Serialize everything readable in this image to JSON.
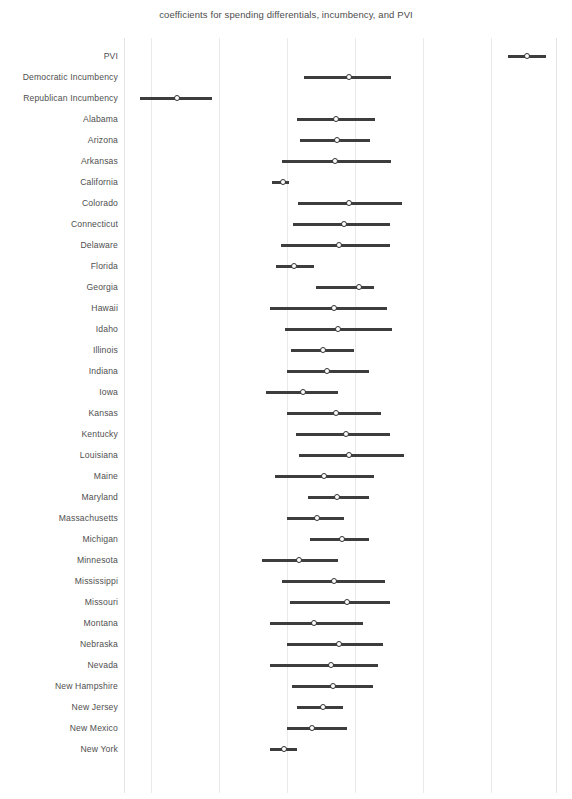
{
  "chart_data": {
    "type": "scatter",
    "title": "coefficients for spending differentials, incumbency, and PVI",
    "xlabel": "",
    "ylabel": "",
    "grid": true,
    "legend": null,
    "xlim": [
      -3.0,
      3.35
    ],
    "x_gridlines": [
      -2.6,
      -1.6,
      -0.6,
      0.4,
      1.4,
      2.4
    ],
    "plot_px": {
      "left": 124,
      "right": 556,
      "top": 38,
      "bottom": 793
    },
    "row_height_px": 21,
    "first_row_center_y_px": 56,
    "marker": "point-with-error-bar",
    "point_color": "#ffffff",
    "point_edge_color": "#2f2f2f",
    "bar_color": "#3d3d3d",
    "grid_color": "#e9e9ec",
    "categories": [
      "PVI",
      "Democratic Incumbency",
      "Republican Incumbency",
      "Alabama",
      "Arizona",
      "Arkansas",
      "California",
      "Colorado",
      "Connecticut",
      "Delaware",
      "Florida",
      "Georgia",
      "Hawaii",
      "Idaho",
      "Illinois",
      "Indiana",
      "Iowa",
      "Kansas",
      "Kentucky",
      "Louisiana",
      "Maine",
      "Maryland",
      "Massachusetts",
      "Michigan",
      "Minnesota",
      "Mississippi",
      "Missouri",
      "Montana",
      "Nebraska",
      "Nevada",
      "New Hampshire",
      "New Jersey",
      "New Mexico",
      "New York"
    ],
    "points": [
      {
        "label": "PVI",
        "estimate": 2.92,
        "low": 2.65,
        "high": 3.2
      },
      {
        "label": "Democratic Incumbency",
        "estimate": 0.3,
        "low": -0.35,
        "high": 0.93
      },
      {
        "label": "Republican Incumbency",
        "estimate": -2.22,
        "low": -2.76,
        "high": -1.7
      },
      {
        "label": "Alabama",
        "estimate": 0.12,
        "low": -0.46,
        "high": 0.69
      },
      {
        "label": "Arizona",
        "estimate": 0.13,
        "low": -0.42,
        "high": 0.62
      },
      {
        "label": "Arkansas",
        "estimate": 0.1,
        "low": -0.68,
        "high": 0.93
      },
      {
        "label": "California",
        "estimate": -0.67,
        "low": -0.83,
        "high": -0.58
      },
      {
        "label": "Colorado",
        "estimate": 0.3,
        "low": -0.44,
        "high": 1.09
      },
      {
        "label": "Connecticut",
        "estimate": 0.23,
        "low": -0.52,
        "high": 0.91
      },
      {
        "label": "Delaware",
        "estimate": 0.16,
        "low": -0.69,
        "high": 0.91
      },
      {
        "label": "Florida",
        "estimate": -0.5,
        "low": -0.76,
        "high": -0.2
      },
      {
        "label": "Georgia",
        "estimate": 0.45,
        "low": -0.18,
        "high": 0.68
      },
      {
        "label": "Hawaii",
        "estimate": 0.09,
        "low": -0.86,
        "high": 0.86
      },
      {
        "label": "Idaho",
        "estimate": 0.15,
        "low": -0.63,
        "high": 0.94
      },
      {
        "label": "Illinois",
        "estimate": -0.07,
        "low": -0.55,
        "high": 0.38
      },
      {
        "label": "Indiana",
        "estimate": -0.01,
        "low": -0.61,
        "high": 0.6
      },
      {
        "label": "Iowa",
        "estimate": -0.37,
        "low": -0.92,
        "high": 0.15
      },
      {
        "label": "Kansas",
        "estimate": 0.11,
        "low": -0.61,
        "high": 0.78
      },
      {
        "label": "Kentucky",
        "estimate": 0.27,
        "low": -0.47,
        "high": 0.91
      },
      {
        "label": "Louisiana",
        "estimate": 0.3,
        "low": -0.43,
        "high": 1.12
      },
      {
        "label": "Maine",
        "estimate": -0.06,
        "low": -0.78,
        "high": 0.67
      },
      {
        "label": "Maryland",
        "estimate": 0.13,
        "low": -0.29,
        "high": 0.6
      },
      {
        "label": "Massachusetts",
        "estimate": -0.17,
        "low": -0.6,
        "high": 0.24
      },
      {
        "label": "Michigan",
        "estimate": 0.2,
        "low": -0.27,
        "high": 0.6
      },
      {
        "label": "Minnesota",
        "estimate": -0.43,
        "low": -0.97,
        "high": 0.14
      },
      {
        "label": "Mississippi",
        "estimate": 0.08,
        "low": -0.68,
        "high": 0.83
      },
      {
        "label": "Missouri",
        "estimate": 0.28,
        "low": -0.56,
        "high": 0.91
      },
      {
        "label": "Montana",
        "estimate": -0.2,
        "low": -0.85,
        "high": 0.52
      },
      {
        "label": "Nebraska",
        "estimate": 0.16,
        "low": -0.61,
        "high": 0.81
      },
      {
        "label": "Nevada",
        "estimate": 0.05,
        "low": -0.86,
        "high": 0.74
      },
      {
        "label": "New Hampshire",
        "estimate": 0.07,
        "low": -0.53,
        "high": 0.66
      },
      {
        "label": "New Jersey",
        "estimate": -0.08,
        "low": -0.45,
        "high": 0.22
      },
      {
        "label": "New Mexico",
        "estimate": -0.23,
        "low": -0.61,
        "high": 0.28
      },
      {
        "label": "New York",
        "estimate": -0.65,
        "low": -0.86,
        "high": -0.45
      }
    ]
  }
}
